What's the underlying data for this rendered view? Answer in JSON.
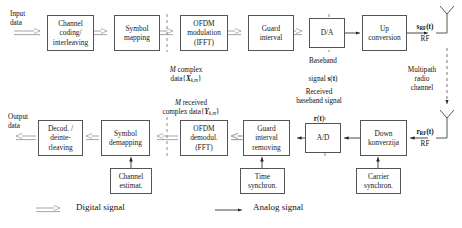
{
  "diagram": {
    "tx_blocks": [
      {
        "id": "channel-coding",
        "label": "Channel\ncoding/\ninterleaving",
        "x": 47,
        "y": 15,
        "w": 47,
        "h": 36
      },
      {
        "id": "symbol-mapping",
        "label": "Symbol\nmapping",
        "x": 114,
        "y": 15,
        "w": 46,
        "h": 36
      },
      {
        "id": "ofdm-modulation",
        "label": "OFDM\nmodulation\n(IFFT)",
        "x": 180,
        "y": 15,
        "w": 48,
        "h": 36
      },
      {
        "id": "guard-interval",
        "label": "Guard\ninterval",
        "x": 248,
        "y": 15,
        "w": 46,
        "h": 36
      },
      {
        "id": "da-converter",
        "label": "D/A",
        "x": 309,
        "y": 18,
        "w": 36,
        "h": 30
      },
      {
        "id": "up-conversion",
        "label": "Up\nconversion",
        "x": 362,
        "y": 15,
        "w": 45,
        "h": 36
      }
    ],
    "rx_blocks": [
      {
        "id": "decoder-deinterleaving",
        "label": "Decod. /\ndeinte-\nrleaving",
        "x": 38,
        "y": 120,
        "w": 45,
        "h": 36
      },
      {
        "id": "symbol-demapping",
        "label": "Symbol\ndemapping",
        "x": 101,
        "y": 120,
        "w": 49,
        "h": 36
      },
      {
        "id": "ofdm-demodulation",
        "label": "OFDM\ndemodul.\n(FFT)",
        "x": 180,
        "y": 120,
        "w": 48,
        "h": 36
      },
      {
        "id": "guard-interval-removing",
        "label": "Guard\ninterval\nremoving",
        "x": 243,
        "y": 120,
        "w": 47,
        "h": 36
      },
      {
        "id": "ad-converter",
        "label": "A/D",
        "x": 305,
        "y": 123,
        "w": 36,
        "h": 30
      },
      {
        "id": "down-conversion",
        "label": "Down\nkonverzija",
        "x": 360,
        "y": 120,
        "w": 47,
        "h": 36
      }
    ],
    "aux_blocks": [
      {
        "id": "channel-estimation",
        "label": "Channel\nestimat.",
        "x": 110,
        "y": 168,
        "w": 42,
        "h": 26
      },
      {
        "id": "time-synchronization",
        "label": "Time\nsynchron.",
        "x": 240,
        "y": 168,
        "w": 45,
        "h": 26
      },
      {
        "id": "carrier-synchronization",
        "label": "Carrier\nsynchron.",
        "x": 356,
        "y": 168,
        "w": 45,
        "h": 26
      }
    ],
    "labels": [
      {
        "id": "input-data",
        "text": "Input\ndata",
        "x": 10,
        "y": 10,
        "w": 36,
        "align": "left"
      },
      {
        "id": "output-data",
        "text": "Output\ndata",
        "x": 8,
        "y": 113,
        "w": 40,
        "align": "left"
      },
      {
        "id": "m-complex-data",
        "text": "M complex",
        "x": 148,
        "y": 57,
        "w": 76,
        "align": "center"
      },
      {
        "id": "m-complex-data-sym",
        "text": "data{X",
        "sub": "k,m",
        "close": "}",
        "x": 148,
        "y": 66,
        "w": 76,
        "align": "center"
      },
      {
        "id": "m-received-data",
        "text": "M received",
        "x": 143,
        "y": 90,
        "w": 96,
        "align": "center"
      },
      {
        "id": "m-received-data-sym",
        "text": "complex data{Y",
        "sub": "k,m",
        "close": "}",
        "x": 143,
        "y": 99,
        "w": 96,
        "align": "center"
      },
      {
        "id": "baseband-signal",
        "text": "Baseband",
        "x": 288,
        "y": 57,
        "w": 70,
        "align": "center"
      },
      {
        "id": "baseband-signal-sym",
        "text": "signal s(t)",
        "x": 288,
        "y": 66,
        "w": 70,
        "align": "center"
      },
      {
        "id": "received-baseband",
        "text": "Received",
        "x": 283,
        "y": 88,
        "w": 72,
        "align": "center"
      },
      {
        "id": "received-baseband-2",
        "text": "baseband signal",
        "x": 283,
        "y": 97,
        "w": 72,
        "align": "center"
      },
      {
        "id": "received-baseband-sym",
        "text": "r(t)",
        "x": 283,
        "y": 106,
        "w": 72,
        "align": "center"
      },
      {
        "id": "tx-rf-signal",
        "text": "s",
        "sub": "RF",
        "close": "(t)",
        "x": 405,
        "y": 14,
        "w": 40,
        "align": "center"
      },
      {
        "id": "tx-rf-label",
        "text": "RF",
        "x": 405,
        "y": 35,
        "w": 40,
        "align": "center"
      },
      {
        "id": "rx-rf-signal",
        "text": "r",
        "sub": "RF",
        "close": "(t)",
        "x": 404,
        "y": 119,
        "w": 42,
        "align": "center"
      },
      {
        "id": "rx-rf-label",
        "text": "RF",
        "x": 404,
        "y": 140,
        "w": 42,
        "align": "center"
      },
      {
        "id": "multipath-channel",
        "text": "Multipath\nradio\nchannel",
        "x": 400,
        "y": 66,
        "w": 44,
        "align": "center"
      }
    ],
    "legend": {
      "digital": "Digital signal",
      "analog": "Analog signal"
    },
    "colors": {
      "stroke": "#555555",
      "digital_arrow": "#8a8a8a",
      "analog_arrow": "#333333",
      "dashed": "#888888",
      "background": "#ffffff"
    }
  }
}
